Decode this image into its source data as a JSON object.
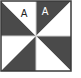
{
  "figure": {
    "colors": {
      "dark": "#4a4a4a",
      "light": "#ffffff",
      "border": "#3a3a3a"
    },
    "labels": [
      {
        "id": "label-a-white",
        "text": "A",
        "region": "top-left quadrant, upper-right white triangle"
      },
      {
        "id": "label-a-dark",
        "text": "A",
        "region": "top-right quadrant, upper-left dark triangle"
      }
    ]
  }
}
